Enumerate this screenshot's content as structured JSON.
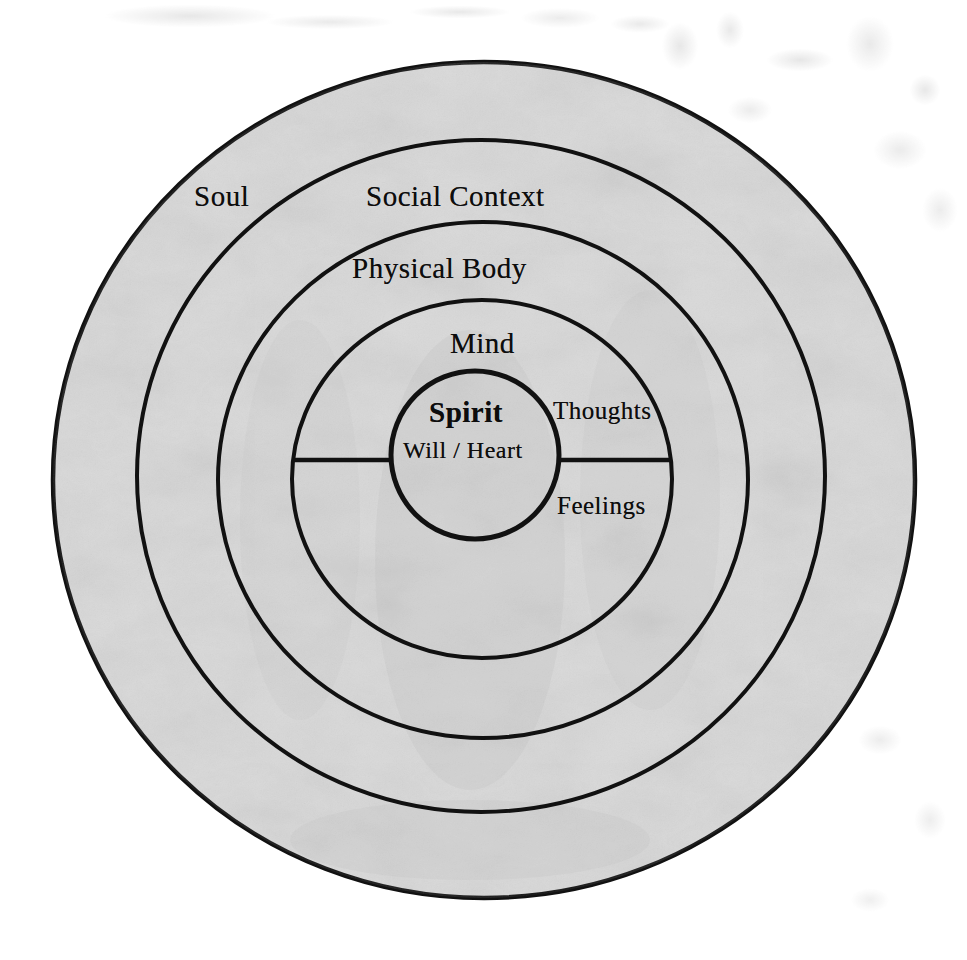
{
  "diagram": {
    "title_text": "",
    "style": {
      "ring_fill": "#d9d9d9",
      "stroke_color": "#111111",
      "page_background": "#ffffff",
      "text_color": "#0d0d0d"
    },
    "rings": [
      {
        "key": "soul",
        "label": "Soul",
        "cx": 484,
        "cy": 480,
        "rx": 431,
        "ry": 418
      },
      {
        "key": "social-context",
        "label": "Social Context",
        "cx": 481,
        "cy": 476,
        "rx": 344,
        "ry": 336
      },
      {
        "key": "physical-body",
        "label": "Physical Body",
        "cx": 483,
        "cy": 480,
        "rx": 265,
        "ry": 258
      },
      {
        "key": "mind",
        "label": "Mind",
        "cx": 482,
        "cy": 479,
        "rx": 190,
        "ry": 179
      },
      {
        "key": "spirit",
        "label": "Spirit",
        "cx": 475,
        "cy": 455,
        "rx": 85,
        "ry": 84
      }
    ],
    "center": {
      "primary_label": "Spirit",
      "secondary_label": "Will / Heart"
    },
    "divider": {
      "orientation": "horizontal",
      "y": 460,
      "x_start": 293,
      "x_end": 672,
      "above_label": "Thoughts",
      "below_label": "Feelings"
    },
    "labels": {
      "soul": "Soul",
      "social_context": "Social Context",
      "physical_body": "Physical Body",
      "mind": "Mind",
      "spirit": "Spirit",
      "will_heart": "Will / Heart",
      "thoughts": "Thoughts",
      "feelings": "Feelings"
    }
  }
}
